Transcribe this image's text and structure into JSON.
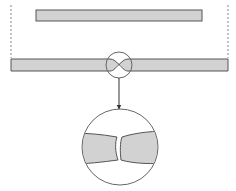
{
  "diagram": {
    "type": "technical-illustration",
    "colors": {
      "background": "#ffffff",
      "bar_fill": "#d2d2d2",
      "bar_stroke": "#555555",
      "line_stroke": "#666666",
      "dash_stroke": "#888888"
    },
    "elements": {
      "top_bar": {
        "x": 36,
        "y": 10,
        "width": 166,
        "height": 11
      },
      "bottom_bar": {
        "x": 11,
        "y": 59,
        "width": 217,
        "height": 12
      },
      "guide_lines": [
        {
          "x": 11,
          "y1": 5,
          "y2": 59
        },
        {
          "x": 228,
          "y1": 5,
          "y2": 59
        }
      ],
      "joint_circle": {
        "cx": 119,
        "cy": 65,
        "r": 13
      },
      "arrow": {
        "x": 119,
        "y1": 78,
        "y2": 109
      },
      "detail_circle": {
        "cx": 120,
        "cy": 147,
        "r": 38
      }
    },
    "labels": []
  }
}
